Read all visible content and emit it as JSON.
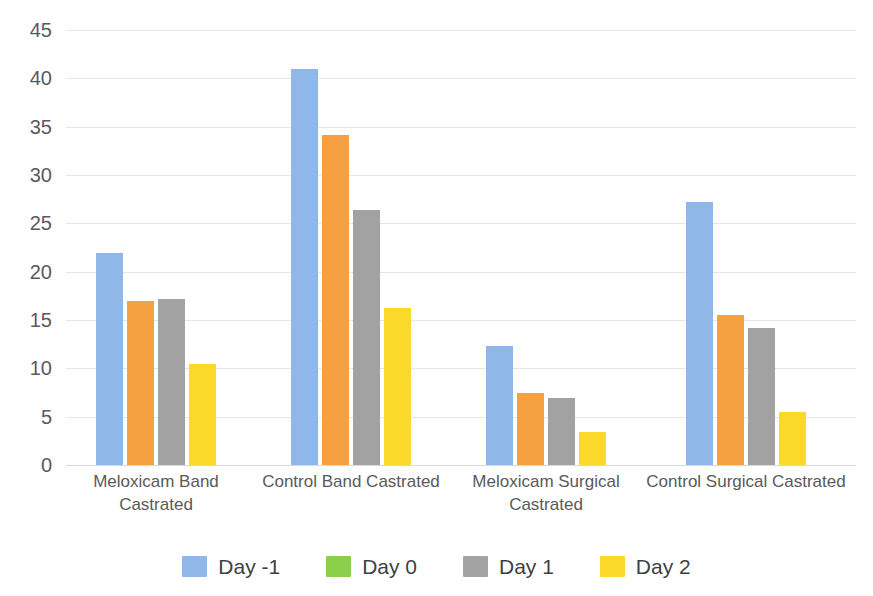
{
  "chart_data": {
    "type": "bar",
    "title": "",
    "subtitle": "",
    "xlabel": "",
    "ylabel": "",
    "ylim": [
      0,
      45
    ],
    "y_ticks": [
      0,
      5,
      10,
      15,
      20,
      25,
      30,
      35,
      40,
      45
    ],
    "y_tick_labels": [
      "0",
      "5",
      "10",
      "15",
      "20",
      "25",
      "30",
      "35",
      "40",
      "45"
    ],
    "grid": true,
    "legend_position": "bottom",
    "categories": [
      "Meloxicam Band Castrated",
      "Control Band Castrated",
      "Meloxicam Surgical Castrated",
      "Control Surgical Castrated"
    ],
    "category_label_lines": [
      [
        "Meloxicam Band Castrated"
      ],
      [
        "Control Band Castrated"
      ],
      [
        "Meloxicam Surgical",
        "Castrated"
      ],
      [
        "Control Surgical Castrated"
      ]
    ],
    "series": [
      {
        "name": "Day -1",
        "color": "#8FB8E8",
        "values": [
          21.9,
          41.0,
          12.3,
          27.2
        ]
      },
      {
        "name": "Day 0",
        "color": "#8BD04A",
        "values": [
          0,
          0,
          0,
          0
        ]
      },
      {
        "name": "Day 1",
        "color": "#A2A2A2",
        "values": [
          17.2,
          26.4,
          6.9,
          14.2
        ]
      },
      {
        "name": "Day 2",
        "color": "#FBD92B",
        "values": [
          10.5,
          16.2,
          3.4,
          5.5
        ]
      }
    ],
    "series_drawn_order": [
      {
        "name": "Day -1",
        "color": "#8FB8E8",
        "values": [
          21.9,
          41.0,
          12.3,
          27.2
        ]
      },
      {
        "name": "Day 0-orange",
        "color": "#F5A041",
        "values": [
          17.0,
          34.1,
          7.4,
          15.5
        ]
      },
      {
        "name": "Day 1",
        "color": "#A2A2A2",
        "values": [
          17.2,
          26.4,
          6.9,
          14.2
        ]
      },
      {
        "name": "Day 2",
        "color": "#FBD92B",
        "values": [
          10.5,
          16.2,
          3.4,
          5.5
        ]
      }
    ],
    "bars": [
      {
        "group": "Meloxicam Band Castrated",
        "series": "Day -1",
        "value": 21.9,
        "color": "#8FB8E8"
      },
      {
        "group": "Meloxicam Band Castrated",
        "series": "Day 0",
        "value": 17.0,
        "color": "#F5A041"
      },
      {
        "group": "Meloxicam Band Castrated",
        "series": "Day 1",
        "value": 17.2,
        "color": "#A2A2A2"
      },
      {
        "group": "Meloxicam Band Castrated",
        "series": "Day 2",
        "value": 10.5,
        "color": "#FBD92B"
      },
      {
        "group": "Control Band Castrated",
        "series": "Day -1",
        "value": 41.0,
        "color": "#8FB8E8"
      },
      {
        "group": "Control Band Castrated",
        "series": "Day 0",
        "value": 34.1,
        "color": "#F5A041"
      },
      {
        "group": "Control Band Castrated",
        "series": "Day 1",
        "value": 26.4,
        "color": "#A2A2A2"
      },
      {
        "group": "Control Band Castrated",
        "series": "Day 2",
        "value": 16.2,
        "color": "#FBD92B"
      },
      {
        "group": "Meloxicam Surgical Castrated",
        "series": "Day -1",
        "value": 12.3,
        "color": "#8FB8E8"
      },
      {
        "group": "Meloxicam Surgical Castrated",
        "series": "Day 0",
        "value": 7.4,
        "color": "#F5A041"
      },
      {
        "group": "Meloxicam Surgical Castrated",
        "series": "Day 1",
        "value": 6.9,
        "color": "#A2A2A2"
      },
      {
        "group": "Meloxicam Surgical Castrated",
        "series": "Day 2",
        "value": 3.4,
        "color": "#FBD92B"
      },
      {
        "group": "Control Surgical Castrated",
        "series": "Day -1",
        "value": 27.2,
        "color": "#8FB8E8"
      },
      {
        "group": "Control Surgical Castrated",
        "series": "Day 0",
        "value": 15.5,
        "color": "#F5A041"
      },
      {
        "group": "Control Surgical Castrated",
        "series": "Day 1",
        "value": 14.2,
        "color": "#A2A2A2"
      },
      {
        "group": "Control Surgical Castrated",
        "series": "Day 2",
        "value": 5.5,
        "color": "#FBD92B"
      }
    ],
    "legend": [
      {
        "label": "Day -1",
        "color": "#8FB8E8"
      },
      {
        "label": "Day 0",
        "color": "#8BD04A"
      },
      {
        "label": "Day 1",
        "color": "#A2A2A2"
      },
      {
        "label": "Day 2",
        "color": "#FBD92B"
      }
    ]
  },
  "layout": {
    "group_left_px": [
      30,
      225,
      420,
      620
    ],
    "bar_width_px": 27,
    "bar_gap_px": 4,
    "group_label_width_px": 200,
    "axis_color": "#e4e6e8",
    "text_color": "#5a5a5a",
    "background": "#ffffff"
  }
}
